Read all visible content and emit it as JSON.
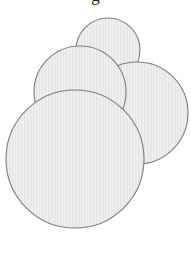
{
  "figure": {
    "background_color": "#ffffff",
    "fill_color": "#e9e9e9",
    "fill_color_alt": "#efefef",
    "stroke_color": "#7d7d7d",
    "texture": "fine vertical hatch",
    "width": 191,
    "height": 278
  },
  "clipped_caption": {
    "text": "g",
    "note": "partial glyph descender cropped at top edge"
  },
  "chart_data": {
    "type": "scatter",
    "xlabel": "",
    "ylabel": "",
    "xlim": [
      0,
      191
    ],
    "ylim": [
      0,
      278
    ],
    "grid": false,
    "legend": "none",
    "series": [
      {
        "name": "circles",
        "marker": "circle",
        "points": [
          {
            "label": "top-small-circle",
            "cx": 108,
            "cy": 50,
            "r": 32,
            "z": 1
          },
          {
            "label": "upper-left-circle",
            "cx": 80,
            "cy": 92,
            "r": 46,
            "z": 3
          },
          {
            "label": "right-large-circle",
            "cx": 137,
            "cy": 113,
            "r": 51,
            "z": 2
          },
          {
            "label": "bottom-large-circle",
            "cx": 75,
            "cy": 159,
            "r": 69,
            "z": 4
          }
        ]
      }
    ]
  }
}
